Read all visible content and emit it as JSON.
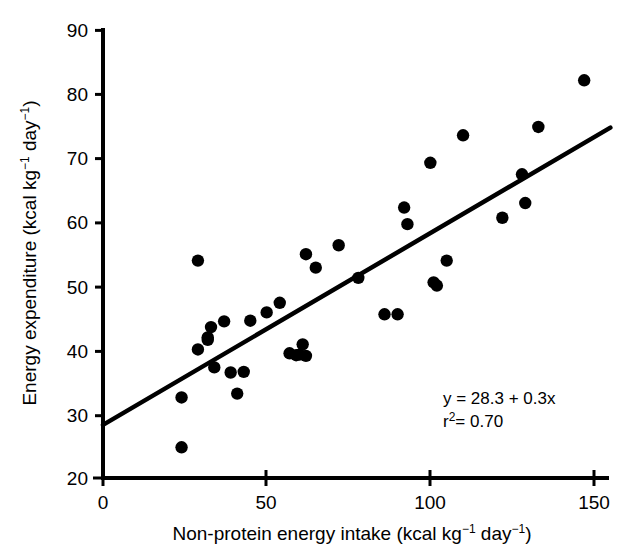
{
  "chart_data": {
    "type": "scatter",
    "title": "",
    "xlabel": "Non-protein energy intake (kcal kg⁻¹ day⁻¹)",
    "ylabel": "Energy expenditure (kcal kg⁻¹ day⁻¹)",
    "xlim": [
      0,
      155
    ],
    "ylim": [
      20,
      90
    ],
    "xticks": [
      0,
      50,
      100,
      150
    ],
    "yticks": [
      20,
      30,
      40,
      50,
      60,
      70,
      80,
      90
    ],
    "xtick_labels": [
      "0",
      "50",
      "100",
      "150"
    ],
    "ytick_labels": [
      "20",
      "30",
      "40",
      "50",
      "60",
      "70",
      "80",
      "90"
    ],
    "grid": false,
    "legend": false,
    "marker": "filled-circle",
    "marker_color": "#000000",
    "points": [
      {
        "x": 24,
        "y": 32.6
      },
      {
        "x": 24,
        "y": 24.8
      },
      {
        "x": 29,
        "y": 54.0
      },
      {
        "x": 29,
        "y": 40.1
      },
      {
        "x": 32,
        "y": 42.0
      },
      {
        "x": 32,
        "y": 41.6
      },
      {
        "x": 33,
        "y": 43.6
      },
      {
        "x": 34,
        "y": 37.3
      },
      {
        "x": 37,
        "y": 44.5
      },
      {
        "x": 39,
        "y": 36.5
      },
      {
        "x": 41,
        "y": 33.2
      },
      {
        "x": 43,
        "y": 36.6
      },
      {
        "x": 45,
        "y": 44.6
      },
      {
        "x": 50,
        "y": 45.9
      },
      {
        "x": 54,
        "y": 47.4
      },
      {
        "x": 57,
        "y": 39.5
      },
      {
        "x": 59,
        "y": 39.2
      },
      {
        "x": 60,
        "y": 39.3
      },
      {
        "x": 61,
        "y": 40.9
      },
      {
        "x": 62,
        "y": 39.1
      },
      {
        "x": 62,
        "y": 55.0
      },
      {
        "x": 65,
        "y": 52.9
      },
      {
        "x": 72,
        "y": 56.4
      },
      {
        "x": 78,
        "y": 51.3
      },
      {
        "x": 86,
        "y": 45.6
      },
      {
        "x": 90,
        "y": 45.6
      },
      {
        "x": 92,
        "y": 62.3
      },
      {
        "x": 93,
        "y": 59.7
      },
      {
        "x": 100,
        "y": 69.3
      },
      {
        "x": 101,
        "y": 50.6
      },
      {
        "x": 102,
        "y": 50.1
      },
      {
        "x": 105,
        "y": 54.0
      },
      {
        "x": 110,
        "y": 73.6
      },
      {
        "x": 122,
        "y": 60.7
      },
      {
        "x": 128,
        "y": 67.5
      },
      {
        "x": 129,
        "y": 63.0
      },
      {
        "x": 133,
        "y": 74.9
      },
      {
        "x": 147,
        "y": 82.2
      }
    ],
    "fit_line": {
      "equation_label": "y = 28.3 + 0.3x",
      "r2_label": "r²= 0.70",
      "intercept": 28.3,
      "slope": 0.3,
      "x_start": 0,
      "x_end": 155,
      "y_start": 28.3,
      "y_end": 74.8
    },
    "annotations": [
      {
        "name": "regression-equation",
        "text": "y = 28.3 + 0.3x"
      },
      {
        "name": "r-squared",
        "text": "r²= 0.70"
      }
    ]
  },
  "axis_title_parts": {
    "x": {
      "prefix": "Non-protein energy intake (kcal kg",
      "sup1": "−1",
      "mid": " day",
      "sup2": "−1",
      "suffix": ")"
    },
    "y": {
      "prefix": "Energy expenditure (kcal kg",
      "sup1": "−1",
      "mid": " day",
      "sup2": "−1",
      "suffix": ")"
    }
  },
  "annotation_lines": {
    "line1_prefix": "y = 28.3 + 0.3x",
    "line2_base": "r",
    "line2_sup": "2",
    "line2_rest": "= 0.70"
  }
}
